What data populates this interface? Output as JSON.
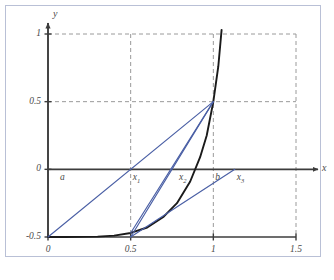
{
  "figure": {
    "kind": "math-plot",
    "frame_color": "#b9c0d6",
    "curve_color": "#1a1a1a",
    "secant_color": "#4a5fa5",
    "grid_color": "#9a9a9a",
    "axis_color": "#3c3c3c",
    "label_color": "#4a4a4a"
  },
  "axes": {
    "x_name": "x",
    "y_name": "y",
    "x_ticks": [
      "0",
      "0.5",
      "1",
      "1.5"
    ],
    "x_tick_values": [
      0,
      0.5,
      1,
      1.5
    ],
    "y_ticks": [
      "-0.5",
      "0",
      "0.5",
      "1"
    ],
    "y_tick_values": [
      -0.5,
      0,
      0.5,
      1
    ],
    "xlim": [
      0,
      1.5
    ],
    "ylim": [
      -0.5,
      1.0
    ],
    "grid": "dashed"
  },
  "point_labels": [
    {
      "id": "a",
      "text": "a",
      "sub": "",
      "x": 0.06,
      "y": 0
    },
    {
      "id": "x1",
      "text": "x",
      "sub": "1",
      "x": 0.5,
      "y": 0
    },
    {
      "id": "x2",
      "text": "x",
      "sub": "2",
      "x": 0.78,
      "y": 0
    },
    {
      "id": "b",
      "text": "b",
      "sub": "",
      "x": 1.0,
      "y": 0
    },
    {
      "id": "x3",
      "text": "x",
      "sub": "3",
      "x": 1.13,
      "y": 0
    }
  ],
  "chart_data": {
    "type": "line",
    "title": "",
    "xlabel": "x",
    "ylabel": "y",
    "xlim": [
      0,
      1.5
    ],
    "ylim": [
      -0.5,
      1.0
    ],
    "grid": true,
    "legend": "none",
    "series": [
      {
        "name": "f(x)",
        "role": "function-curve",
        "color": "#1a1a1a",
        "x": [
          0.0,
          0.1,
          0.2,
          0.3,
          0.4,
          0.5,
          0.6,
          0.7,
          0.78,
          0.86,
          0.92,
          0.96,
          1.0,
          1.03,
          1.05
        ],
        "y": [
          -0.5,
          -0.5,
          -0.499,
          -0.497,
          -0.49,
          -0.47,
          -0.43,
          -0.35,
          -0.25,
          -0.09,
          0.09,
          0.25,
          0.5,
          0.76,
          1.03
        ]
      },
      {
        "name": "secant-1",
        "role": "secant-line",
        "color": "#4a5fa5",
        "x": [
          0.0,
          1.0
        ],
        "y": [
          -0.5,
          0.5
        ]
      },
      {
        "name": "secant-2",
        "role": "secant-line",
        "color": "#4a5fa5",
        "x": [
          0.5,
          1.0
        ],
        "y": [
          -0.5,
          0.5
        ]
      },
      {
        "name": "secant-3",
        "role": "secant-line",
        "color": "#4a5fa5",
        "x": [
          0.5,
          1.0
        ],
        "y": [
          -0.47,
          0.5
        ]
      },
      {
        "name": "secant-4",
        "role": "secant-line",
        "color": "#4a5fa5",
        "x": [
          0.5,
          1.13
        ],
        "y": [
          -0.5,
          0.0
        ]
      }
    ],
    "annotations": [
      {
        "label": "a",
        "x": 0.06,
        "y": 0
      },
      {
        "label": "x1",
        "x": 0.5,
        "y": 0
      },
      {
        "label": "x2",
        "x": 0.78,
        "y": 0
      },
      {
        "label": "b",
        "x": 1.0,
        "y": 0
      },
      {
        "label": "x3",
        "x": 1.13,
        "y": 0
      }
    ]
  }
}
